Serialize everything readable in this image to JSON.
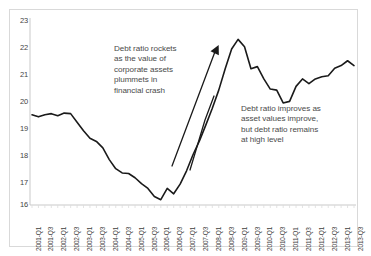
{
  "chart_data": {
    "type": "line",
    "title": "",
    "xlabel": "",
    "ylabel": "",
    "ylim": [
      16,
      23
    ],
    "ytick_step": 1,
    "yticks": [
      23,
      22,
      21,
      20,
      19,
      18,
      17,
      16
    ],
    "grid": false,
    "legend": null,
    "line_color": "#1a1a1a",
    "categories": [
      "2001-Q1",
      "2001-Q2",
      "2001-Q3",
      "2001-Q4",
      "2002-Q1",
      "2002-Q2",
      "2002-Q3",
      "2002-Q4",
      "2003-Q1",
      "2003-Q2",
      "2003-Q3",
      "2003-Q4",
      "2004-Q1",
      "2004-Q2",
      "2004-Q3",
      "2004-Q4",
      "2005-Q1",
      "2005-Q2",
      "2005-Q3",
      "2005-Q4",
      "2006-Q1",
      "2006-Q2",
      "2006-Q3",
      "2006-Q4",
      "2007-Q1",
      "2007-Q2",
      "2007-Q3",
      "2007-Q4",
      "2008-Q1",
      "2008-Q2",
      "2008-Q3",
      "2008-Q4",
      "2009-Q1",
      "2009-Q2",
      "2009-Q3",
      "2009-Q4",
      "2010-Q1",
      "2010-Q2",
      "2010-Q3",
      "2010-Q4",
      "2011-Q1",
      "2011-Q2",
      "2011-Q3",
      "2011-Q4",
      "2012-Q1",
      "2012-Q2",
      "2012-Q3",
      "2012-Q4",
      "2013-Q1",
      "2013-Q2",
      "2013-Q3"
    ],
    "xtick_labels": [
      "2001-Q1",
      "2001-Q3",
      "2002-Q1",
      "2002-Q3",
      "2003-Q1",
      "2003-Q3",
      "2004-Q1",
      "2004-Q3",
      "2005-Q1",
      "2005-Q3",
      "2006-Q1",
      "2006-Q3",
      "2007-Q1",
      "2007-Q3",
      "2008-Q1",
      "2008-Q3",
      "2009-Q1",
      "2009-Q3",
      "2010-Q1",
      "2010-Q3",
      "2011-Q1",
      "2011-Q3",
      "2012-Q1",
      "2012-Q3",
      "2013-Q1",
      "2013-Q3"
    ],
    "series": [
      {
        "name": "Debt ratio",
        "values": [
          19.38,
          19.3,
          19.38,
          19.42,
          19.34,
          19.44,
          19.42,
          19.1,
          18.78,
          18.5,
          18.38,
          18.14,
          17.7,
          17.36,
          17.2,
          17.18,
          17.02,
          16.8,
          16.62,
          16.32,
          16.2,
          16.62,
          16.42,
          16.78,
          17.28,
          17.88,
          18.4,
          19.0,
          19.62,
          20.3,
          21.1,
          21.84,
          22.2,
          21.92,
          21.1,
          21.18,
          20.72,
          20.34,
          20.3,
          19.82,
          19.88,
          20.44,
          20.72,
          20.54,
          20.72,
          20.8,
          20.84,
          21.12,
          21.22,
          21.4,
          21.22
        ]
      }
    ],
    "annotations": [
      {
        "id": "crash",
        "text": "Debt ratio rockets\nas the value of\ncorporate assets\nplummets in\nfinancial crash",
        "arrow": true
      },
      {
        "id": "improve",
        "text": "Debt ratio improves as\nasset values improve,\nbut debt ratio remains\nat high level",
        "arrow": true
      }
    ]
  }
}
